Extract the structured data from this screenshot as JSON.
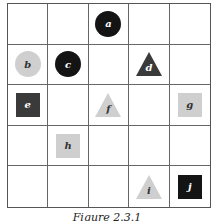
{
  "figure": {
    "caption": "Figure 2.3.1",
    "rows": 5,
    "cols": 5,
    "colors": {
      "black": "#141414",
      "dark": "#3a3a3a",
      "light": "#cfcfcf",
      "grid_line": "#666666",
      "label_on_dark": "#ffffff",
      "label_on_light": "#333333"
    },
    "objects": [
      {
        "label": "a",
        "shape": "circle",
        "shade": "black",
        "row": 0,
        "col": 2
      },
      {
        "label": "b",
        "shape": "circle",
        "shade": "light",
        "row": 1,
        "col": 0
      },
      {
        "label": "c",
        "shape": "circle",
        "shade": "black",
        "row": 1,
        "col": 1
      },
      {
        "label": "d",
        "shape": "triangle",
        "shade": "dark",
        "row": 1,
        "col": 3
      },
      {
        "label": "e",
        "shape": "square",
        "shade": "dark",
        "row": 2,
        "col": 0
      },
      {
        "label": "f",
        "shape": "triangle",
        "shade": "light",
        "row": 2,
        "col": 2
      },
      {
        "label": "g",
        "shape": "square",
        "shade": "light",
        "row": 2,
        "col": 4
      },
      {
        "label": "h",
        "shape": "square",
        "shade": "light",
        "row": 3,
        "col": 1
      },
      {
        "label": "i",
        "shape": "triangle",
        "shade": "light",
        "row": 4,
        "col": 3
      },
      {
        "label": "j",
        "shape": "square",
        "shade": "black",
        "row": 4,
        "col": 4
      }
    ]
  }
}
